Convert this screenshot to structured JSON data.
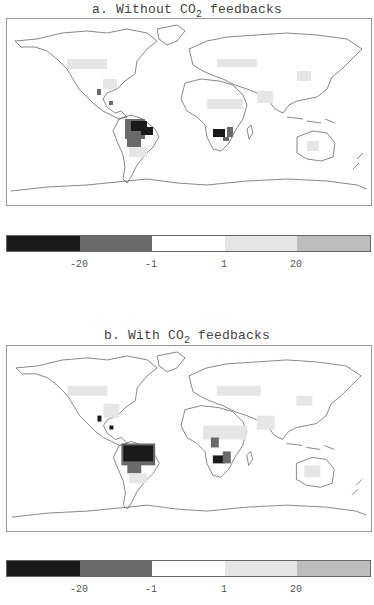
{
  "panels": [
    {
      "id": "a",
      "title_prefix": "a. Without CO",
      "title_sub": "2",
      "title_suffix": " feedbacks",
      "colorbar": {
        "colors": [
          "#1a1a1a",
          "#6a6a6a",
          "#ffffff",
          "#e6e6e6",
          "#bdbdbd"
        ],
        "labels": [
          "-20",
          "-1",
          "1",
          "20"
        ]
      }
    },
    {
      "id": "b",
      "title_prefix": "b. With CO",
      "title_sub": "2",
      "title_suffix": " feedbacks",
      "colorbar": {
        "colors": [
          "#1a1a1a",
          "#6a6a6a",
          "#ffffff",
          "#e6e6e6",
          "#bdbdbd"
        ],
        "labels": [
          "-20",
          "-1",
          "1",
          "20"
        ]
      }
    }
  ],
  "legend_classes": [
    {
      "range": "< -20",
      "color": "#1a1a1a"
    },
    {
      "range": "-20 to -1",
      "color": "#6a6a6a"
    },
    {
      "range": "-1 to 1",
      "color": "#ffffff"
    },
    {
      "range": "1 to 20",
      "color": "#e6e6e6"
    },
    {
      "range": "> 20",
      "color": "#bdbdbd"
    }
  ]
}
